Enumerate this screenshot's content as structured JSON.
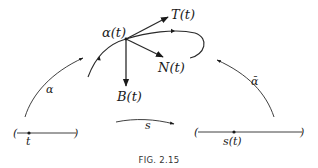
{
  "figure": {
    "caption": "FIG. 2.15",
    "labels": {
      "point": "α(t)",
      "tangent": "T(t)",
      "normal": "N(t)",
      "binormal": "B(t)",
      "map_alpha": "α",
      "map_alpha_bar": "ᾱ",
      "map_s": "s",
      "param_t": "t",
      "param_s_of_t": "s(t)"
    },
    "intervals": [
      {
        "name": "t-interval",
        "left_paren": "(",
        "right_paren": ")"
      },
      {
        "name": "s-interval",
        "left_paren": "(",
        "right_paren": ")"
      }
    ]
  }
}
